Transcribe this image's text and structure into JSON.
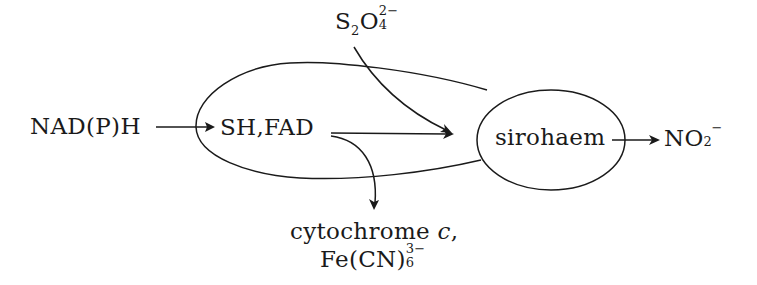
{
  "diagram": {
    "type": "reaction-pathway",
    "nodes": {
      "donor": {
        "label": "NAD(P)H"
      },
      "flavin_site": {
        "label": "SH,FAD"
      },
      "dithionite": {
        "base": "S",
        "sub1": "2",
        "mid": "O",
        "sup": "2−",
        "sub2": "4",
        "text": "S2O4 2−"
      },
      "haem_site": {
        "label": "sirohaem"
      },
      "product": {
        "base": "NO",
        "sub": "2",
        "sup": "−",
        "text": "NO2−"
      },
      "acceptor_line1": {
        "prefix": "cytochrome ",
        "italic": "c",
        "suffix": ","
      },
      "acceptor_line2": {
        "base": "Fe(CN)",
        "sup": "3−",
        "sub": "6",
        "text": "Fe(CN)6 3−"
      }
    },
    "edges": [
      {
        "from": "NAD(P)H",
        "to": "SH,FAD"
      },
      {
        "from": "SH,FAD",
        "to": "sirohaem"
      },
      {
        "from": "S2O4 2−",
        "to": "sirohaem"
      },
      {
        "from": "SH,FAD",
        "to": "cytochrome c, Fe(CN)6 3−"
      },
      {
        "from": "sirohaem",
        "to": "NO2−"
      }
    ],
    "stroke_color": "#1a1a1a"
  }
}
